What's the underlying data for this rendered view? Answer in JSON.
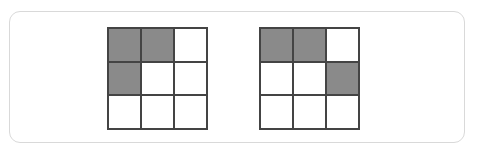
{
  "diagram": {
    "colors": {
      "filled": "#8a8a8a",
      "empty": "#ffffff",
      "line": "#444444",
      "panel_border": "#d9d9d9"
    },
    "grids": [
      {
        "name": "grid-left",
        "left": 107,
        "rows": 3,
        "cols": 3,
        "cells": [
          [
            1,
            1,
            0
          ],
          [
            1,
            0,
            0
          ],
          [
            0,
            0,
            0
          ]
        ]
      },
      {
        "name": "grid-right",
        "left": 259,
        "rows": 3,
        "cols": 3,
        "cells": [
          [
            1,
            1,
            0
          ],
          [
            0,
            0,
            1
          ],
          [
            0,
            0,
            0
          ]
        ]
      }
    ]
  }
}
